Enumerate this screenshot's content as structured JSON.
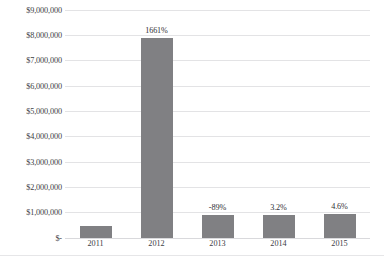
{
  "chart_data": {
    "type": "bar",
    "title": "",
    "xlabel": "",
    "ylabel": "",
    "categories": [
      "2011",
      "2012",
      "2013",
      "2014",
      "2015"
    ],
    "values": [
      450000,
      7870000,
      870000,
      900000,
      940000
    ],
    "data_labels": [
      "",
      "1661%",
      "-89%",
      "3.2%",
      "4.6%"
    ],
    "ylim": [
      0,
      9000000
    ],
    "ytick_labels": [
      "$9,000,000",
      "$8,000,000",
      "$7,000,000",
      "$6,000,000",
      "$5,000,000",
      "$4,000,000",
      "$3,000,000",
      "$2,000,000",
      "$1,000,000",
      "$-"
    ],
    "ytick_values": [
      9000000,
      8000000,
      7000000,
      6000000,
      5000000,
      4000000,
      3000000,
      2000000,
      1000000,
      0
    ],
    "grid": true,
    "legend": "none",
    "series": [
      {
        "name": "",
        "values": [
          450000,
          7870000,
          870000,
          900000,
          940000
        ]
      }
    ],
    "colors": {
      "bar": "#808083",
      "gridline": "#e3e3e5",
      "text": "#404044"
    }
  }
}
